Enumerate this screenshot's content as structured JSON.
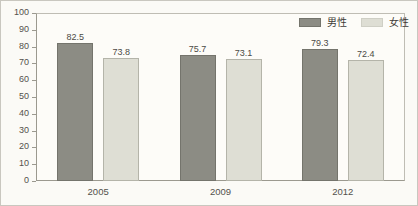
{
  "chart_data": {
    "type": "bar",
    "title": "",
    "subtitle": "",
    "xlabel": "",
    "ylabel": "",
    "categories": [
      "2005",
      "2009",
      "2012"
    ],
    "series": [
      {
        "name": "男性",
        "color": "#8c8c84",
        "values": [
          82.5,
          75.7,
          79.3
        ],
        "value_labels": [
          "82.5",
          "75.7",
          "79.3"
        ]
      },
      {
        "name": "女性",
        "color": "#deded4",
        "values": [
          73.8,
          73.1,
          72.4
        ],
        "value_labels": [
          "73.8",
          "73.1",
          "72.4"
        ]
      }
    ],
    "ylim": [
      0,
      100
    ],
    "ytick_step": 10,
    "ytick_labels": [
      "100",
      "90",
      "80",
      "70",
      "60",
      "50",
      "40",
      "30",
      "20",
      "10",
      "0"
    ],
    "grid": false,
    "legend_position": "top-right",
    "annotations": []
  },
  "legend": {
    "items": [
      {
        "label": "男性",
        "swatch": "male"
      },
      {
        "label": "女性",
        "swatch": "female"
      }
    ]
  },
  "frame": {
    "border_color": "#c9c7bf",
    "background": "#fbfaf6",
    "plot_background": "#fdfcf8"
  }
}
